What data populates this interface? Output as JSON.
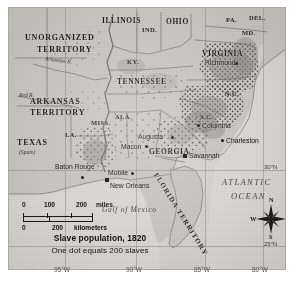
{
  "figure": {
    "name": "slave-population-1820-map",
    "caption_title": "Slave population, 1820",
    "caption_subtitle": "One dot equals 200 slaves"
  },
  "scale_bar": {
    "miles": {
      "ticks": [
        "0",
        "100",
        "200"
      ],
      "unit": "miles"
    },
    "kilometers": {
      "ticks": [
        "0",
        "200"
      ],
      "unit": "kilometers"
    }
  },
  "compass": {
    "n": "N",
    "s": "S",
    "e": "E",
    "w": "W"
  },
  "graticule": {
    "longitudes": [
      "95°W",
      "90°W",
      "85°W",
      "80°W"
    ],
    "latitudes": [
      "30°N",
      "25°N"
    ]
  },
  "territories": [
    {
      "name": "UNORGANIZED TERRITORY",
      "line1": "UNORGANIZED",
      "line2": "TERRITORY"
    },
    {
      "name": "ARKANSAS TERRITORY",
      "line1": "ARKANSAS",
      "line2": "TERRITORY"
    },
    {
      "name": "TEXAS",
      "line1": "TEXAS",
      "line2": "(Spain)"
    },
    {
      "name": "FLORIDA TERRITORY",
      "line1": "FLORIDA TERRITORY"
    }
  ],
  "states": [
    {
      "label": "ILLINOIS"
    },
    {
      "label": "IND."
    },
    {
      "label": "OHIO"
    },
    {
      "label": "PA."
    },
    {
      "label": "DEL."
    },
    {
      "label": "MD."
    },
    {
      "label": "VIRGINIA"
    },
    {
      "label": "KY."
    },
    {
      "label": "TENNESSEE"
    },
    {
      "label": "N.C."
    },
    {
      "label": "S.C."
    },
    {
      "label": "GEORGIA"
    },
    {
      "label": "ALA."
    },
    {
      "label": "MISS."
    },
    {
      "label": "LA."
    }
  ],
  "cities": [
    {
      "label": "Richmond"
    },
    {
      "label": "Columbia"
    },
    {
      "label": "Charleston"
    },
    {
      "label": "Augusta"
    },
    {
      "label": "Macon"
    },
    {
      "label": "Savannah"
    },
    {
      "label": "Mobile"
    },
    {
      "label": "New Orleans"
    },
    {
      "label": "Baton Rouge"
    }
  ],
  "water_features": [
    {
      "label": "Gulf of Mexico"
    },
    {
      "label": "ATLANTIC"
    },
    {
      "label": "OCEAN"
    }
  ],
  "rivers": [
    {
      "label": "Red R."
    },
    {
      "label": "Arkansas R."
    }
  ],
  "colors": {
    "paper": "#cfcdc6",
    "land": "#c9c7c0",
    "water": "#dbd9d3",
    "dots": "#4a4740",
    "dense_shading": "#8d8a82",
    "ink": "#1e1c18"
  }
}
